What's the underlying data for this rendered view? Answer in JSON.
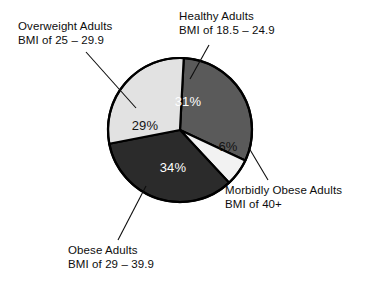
{
  "chart_data": {
    "type": "pie",
    "title": "",
    "subtitle": "",
    "xlabel": "",
    "ylabel": "",
    "legend_position": "callouts",
    "grid": false,
    "units": "percent",
    "total": 100,
    "categories": [
      "Healthy Adults",
      "Morbidly Obese Adults",
      "Obese Adults",
      "Overweight Adults"
    ],
    "values": [
      31,
      6,
      34,
      29
    ],
    "slices": [
      {
        "name": "Healthy Adults",
        "label_line1": "Healthy Adults",
        "label_line2": "BMI of 18.5 – 24.9",
        "value": 31,
        "value_label": "31%",
        "color": "#5a5a5a",
        "label_text_color": "#ffffff",
        "start_angle": -87,
        "end_angle": 25
      },
      {
        "name": "Morbidly Obese Adults",
        "label_line1": "Morbidly Obese Adults",
        "label_line2": "BMI of 40+",
        "value": 6,
        "value_label": "6%",
        "color": "#f2f2f2",
        "label_text_color": "#141414",
        "start_angle": 25,
        "end_angle": 47
      },
      {
        "name": "Obese Adults",
        "label_line1": "Obese Adults",
        "label_line2": "BMI of 29 – 39.9",
        "value": 34,
        "value_label": "34%",
        "color": "#2b2b2b",
        "label_text_color": "#ffffff",
        "start_angle": 47,
        "end_angle": 169
      },
      {
        "name": "Overweight Adults",
        "label_line1": "Overweight Adults",
        "label_line2": "BMI of 25 – 29.9",
        "value": 29,
        "value_label": "29%",
        "color": "#e2e2e2",
        "label_text_color": "#141414",
        "start_angle": 169,
        "end_angle": 273
      }
    ]
  },
  "callouts": {
    "overweight": {
      "line1": "Overweight Adults",
      "line2": "BMI of 25 – 29.9"
    },
    "healthy": {
      "line1": "Healthy Adults",
      "line2": "BMI of 18.5 – 24.9"
    },
    "morbid": {
      "line1": "Morbidly Obese Adults",
      "line2": "BMI of 40+"
    },
    "obese": {
      "line1": "Obese Adults",
      "line2": "BMI of 29 – 39.9"
    }
  },
  "slice_value_labels": {
    "healthy": "31%",
    "morbid": "6%",
    "obese": "34%",
    "overweight": "29%"
  },
  "colors": {
    "healthy": "#5a5a5a",
    "morbid": "#f2f2f2",
    "obese": "#2b2b2b",
    "overweight": "#e2e2e2",
    "outline": "#000000",
    "background": "#ffffff",
    "text": "#0d0d0d"
  }
}
